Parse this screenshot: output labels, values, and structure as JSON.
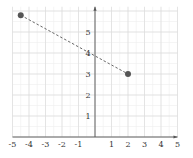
{
  "chart_data": {
    "type": "scatter",
    "title": "",
    "xlabel": "",
    "ylabel": "",
    "xlim": [
      -5,
      5
    ],
    "ylim": [
      0,
      6.2
    ],
    "grid": true,
    "x_ticks": [
      -5,
      -4,
      -3,
      -2,
      -1,
      1,
      2,
      3,
      4,
      5
    ],
    "y_ticks": [
      1,
      2,
      3,
      4,
      5
    ],
    "x_tick_labels": [
      "-5",
      "-4",
      "-3",
      "-2",
      "-1",
      "1",
      "2",
      "3",
      "4",
      "5"
    ],
    "y_tick_labels": [
      "1",
      "2",
      "3",
      "4",
      "5"
    ],
    "points": [
      {
        "x": -4.5,
        "y": 5.8
      },
      {
        "x": 2,
        "y": 3
      }
    ],
    "segment": {
      "from": {
        "x": -4.5,
        "y": 5.8
      },
      "to": {
        "x": 2,
        "y": 3
      },
      "style": "dashed"
    },
    "legend": null
  },
  "colors": {
    "axis": "#555555",
    "grid_major": "#dcdcdc",
    "grid_minor": "#eeeeee",
    "point": "#555555",
    "segment": "#666666",
    "label": "#333333"
  }
}
